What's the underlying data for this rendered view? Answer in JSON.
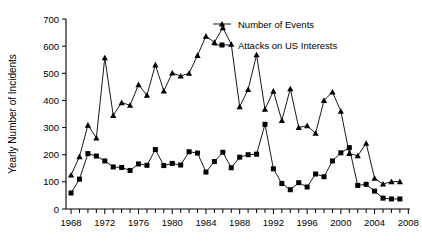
{
  "chart_data": {
    "type": "line",
    "title": "",
    "xlabel": "",
    "ylabel": "Yearly Number of Incidents",
    "xlim": [
      1967.4,
      2008.2
    ],
    "ylim": [
      0,
      700
    ],
    "ytick_step": 100,
    "yticks": [
      0,
      100,
      200,
      300,
      400,
      500,
      600,
      700
    ],
    "xticks_labeled": [
      1968,
      1972,
      1976,
      1980,
      1984,
      1988,
      1992,
      1996,
      2000,
      2004,
      2008
    ],
    "xtick_minor_step": 1,
    "grid": false,
    "legend_position": "top-right",
    "x": [
      1968,
      1969,
      1970,
      1971,
      1972,
      1973,
      1974,
      1975,
      1976,
      1977,
      1978,
      1979,
      1980,
      1981,
      1982,
      1983,
      1984,
      1985,
      1986,
      1987,
      1988,
      1989,
      1990,
      1991,
      1992,
      1993,
      1994,
      1995,
      1996,
      1997,
      1998,
      1999,
      2000,
      2001,
      2002,
      2003,
      2004,
      2005,
      2006,
      2007
    ],
    "series": [
      {
        "name": "Number of Events",
        "marker": "triangle",
        "values": [
          125,
          193,
          309,
          262,
          557,
          345,
          392,
          382,
          458,
          419,
          531,
          435,
          501,
          490,
          500,
          566,
          637,
          614,
          668,
          607,
          377,
          440,
          568,
          368,
          434,
          326,
          443,
          300,
          307,
          279,
          400,
          431,
          360,
          205,
          196,
          242,
          113,
          92,
          101,
          101
        ]
      },
      {
        "name": "Attacks on US Interests",
        "marker": "square",
        "values": [
          59,
          110,
          204,
          195,
          177,
          155,
          153,
          142,
          166,
          161,
          219,
          160,
          168,
          162,
          211,
          206,
          136,
          175,
          209,
          152,
          191,
          200,
          202,
          312,
          148,
          94,
          71,
          97,
          81,
          129,
          119,
          177,
          207,
          226,
          87,
          91,
          66,
          40,
          37,
          37
        ]
      }
    ]
  },
  "legend": {
    "items": [
      {
        "label": "Number of Events",
        "marker": "triangle-marker"
      },
      {
        "label": "Attacks on US Interests",
        "marker": "square-marker"
      }
    ]
  },
  "axes": {
    "y_axis_title": "Yearly Number of Incidents",
    "y_tick_labels": [
      "0",
      "100",
      "200",
      "300",
      "400",
      "500",
      "600",
      "700"
    ],
    "x_tick_labels": [
      "1968",
      "1972",
      "1976",
      "1980",
      "1984",
      "1988",
      "1992",
      "1996",
      "2000",
      "2004",
      "2008"
    ]
  },
  "colors": {
    "ink": "#000000",
    "background": "#ffffff"
  }
}
